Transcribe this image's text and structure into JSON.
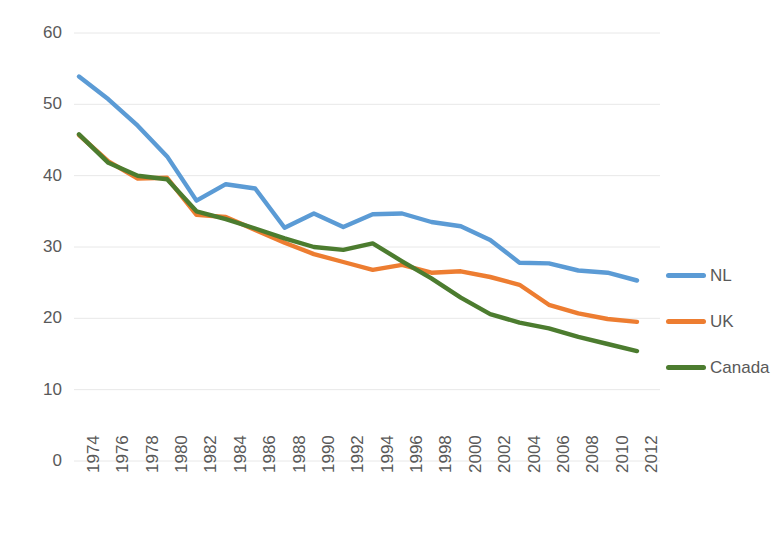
{
  "chart_data": {
    "type": "line",
    "title": "",
    "subtitle": "",
    "xlabel": "",
    "ylabel": "",
    "xlim": [
      1974,
      2012
    ],
    "ylim": [
      0,
      60
    ],
    "grid": true,
    "grid_axis": "y",
    "legend_position": "right",
    "x": [
      1974,
      1976,
      1978,
      1980,
      1982,
      1984,
      1986,
      1988,
      1990,
      1992,
      1994,
      1996,
      1998,
      2000,
      2002,
      2004,
      2006,
      2008,
      2010,
      2012
    ],
    "xticklabels": [
      "1974",
      "1976",
      "1978",
      "1980",
      "1982",
      "1984",
      "1986",
      "1988",
      "1990",
      "1992",
      "1994",
      "1996",
      "1998",
      "2000",
      "2002",
      "2004",
      "2006",
      "2008",
      "2010",
      "2012"
    ],
    "yticks": [
      0,
      10,
      20,
      30,
      40,
      50,
      60
    ],
    "yticklabels": [
      "0",
      "10",
      "20",
      "30",
      "40",
      "50",
      "60"
    ],
    "series": [
      {
        "name": "NL",
        "color": "#5B9BD5",
        "values": [
          53.9,
          50.7,
          47.0,
          42.7,
          36.5,
          38.8,
          38.2,
          32.7,
          34.7,
          32.8,
          34.6,
          34.7,
          33.5,
          32.9,
          31.0,
          27.8,
          27.7,
          26.7,
          26.4,
          25.3
        ]
      },
      {
        "name": "UK",
        "color": "#ED7D31",
        "values": [
          45.7,
          42.0,
          39.6,
          39.7,
          34.5,
          34.2,
          32.4,
          30.6,
          29.0,
          27.9,
          26.8,
          27.5,
          26.4,
          26.6,
          25.8,
          24.7,
          21.9,
          20.7,
          19.9,
          19.5
        ]
      },
      {
        "name": "Canada",
        "color": "#4C7C2F",
        "values": [
          45.8,
          41.8,
          40.0,
          39.5,
          35.0,
          33.9,
          32.6,
          31.2,
          30.0,
          29.6,
          30.5,
          28.0,
          25.6,
          22.9,
          20.6,
          19.4,
          18.6,
          17.4,
          16.4,
          15.4
        ]
      }
    ]
  },
  "legend": {
    "items": [
      {
        "label": "NL",
        "color": "#5B9BD5"
      },
      {
        "label": "UK",
        "color": "#ED7D31"
      },
      {
        "label": "Canada",
        "color": "#4C7C2F"
      }
    ]
  },
  "axes": {
    "y_axis_name": "value-axis",
    "x_axis_name": "year-axis"
  }
}
